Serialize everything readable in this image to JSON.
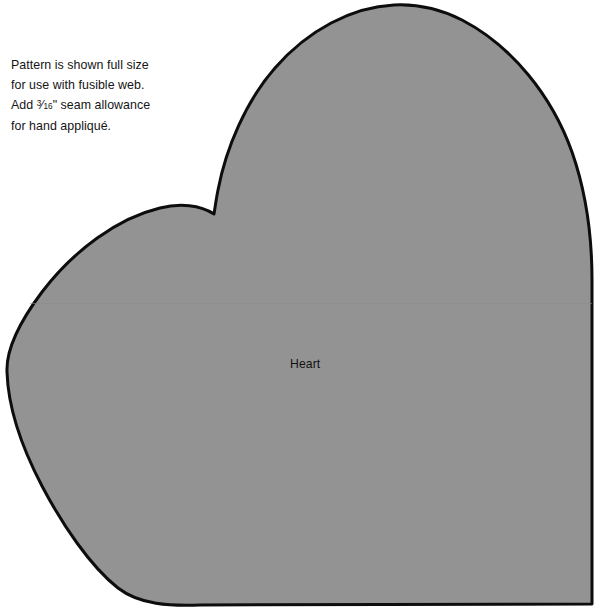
{
  "page": {
    "background_color": "#ffffff",
    "width": 602,
    "height": 616,
    "document_type": "quilting applique pattern sheet"
  },
  "instructions": {
    "text_before_fraction": "Pattern is shown full size for use with fusible web. Add ",
    "fraction_numerator": "3",
    "fraction_slash": "⁄",
    "fraction_denominator": "16",
    "text_after_fraction": "\" seam allowance for hand appliqué.",
    "full_text": "Pattern is shown full size for use with fusible web. Add 3/16\" seam allowance for hand appliqué.",
    "lines": [
      "Pattern is shown full",
      "size for use with fusible",
      "web. Add 3/16\" seam",
      "allowance for hand",
      "appliqué."
    ],
    "text_color": "#151515"
  },
  "pattern_piece": {
    "label": "Heart",
    "label_color": "#121212",
    "fill_color": "#939393",
    "outline_color": "#0d0d0d",
    "outline_width": 3,
    "shape": "heart",
    "cropped": true,
    "crop_note": "piece extends past right and bottom edges of the sheet",
    "seam_line_color": "#8d8d8d",
    "geometry": {
      "cleft_point": [
        214,
        214
      ],
      "right_lobe_apex": [
        395,
        5
      ],
      "leftmost_point": [
        7,
        370
      ],
      "right_edge_x": 592,
      "bottom_edge_y": 604,
      "bottom_right_corner": [
        592,
        604
      ]
    }
  }
}
